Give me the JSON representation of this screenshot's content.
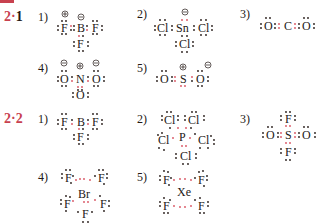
{
  "header": {
    "label": "解 答"
  },
  "sections": [
    {
      "id": "2·1",
      "label_prefix": "2",
      "label_dot": "·",
      "label_num": "1",
      "items": [
        {
          "number": "1)",
          "species": "BF4-",
          "atoms": [
            "F",
            "B",
            "F",
            "F"
          ],
          "charges": [
            "⊕ on F",
            "⊖ on B"
          ]
        },
        {
          "number": "2)",
          "species": "SnCl3-",
          "atoms": [
            "Cl",
            "Sn",
            "Cl",
            "Cl"
          ],
          "charges": [
            "⊖ on Sn"
          ]
        },
        {
          "number": "3)",
          "species": "CO2",
          "atoms": [
            "O",
            "C",
            "O"
          ],
          "charges": []
        },
        {
          "number": "4)",
          "species": "NO3-",
          "atoms": [
            "O",
            "N",
            "O",
            "O"
          ],
          "charges": [
            "⊖ on O",
            "⊕ on N",
            "⊖ on O"
          ]
        },
        {
          "number": "5)",
          "species": "SO2",
          "atoms": [
            "O",
            "S",
            "O"
          ],
          "charges": [
            "⊕ on S",
            "⊖ on O"
          ]
        }
      ]
    },
    {
      "id": "2·2",
      "label_prefix": "2",
      "label_dot": "·",
      "label_num": "2",
      "items": [
        {
          "number": "1)",
          "species": "BF3",
          "atoms": [
            "F",
            "B",
            "F",
            "F"
          ]
        },
        {
          "number": "2)",
          "species": "PCl5",
          "atoms": [
            "Cl",
            "Cl",
            "P",
            "Cl",
            "Cl",
            "Cl"
          ]
        },
        {
          "number": "3)",
          "species": "SO2F2",
          "atoms": [
            "F",
            "O",
            "S",
            "O",
            "F"
          ]
        },
        {
          "number": "4)",
          "species": "BrF5",
          "atoms": [
            "F",
            "F",
            "Br",
            "F",
            "F",
            "F"
          ]
        },
        {
          "number": "5)",
          "species": "XeF4",
          "atoms": [
            "F",
            "F",
            "Xe",
            "F",
            "F"
          ]
        }
      ]
    }
  ],
  "symbols": {
    "plus": "⊕",
    "minus": "⊖"
  },
  "colors": {
    "accent": "#c8414f",
    "text": "#231815",
    "shared_pair": "#d9505e"
  }
}
